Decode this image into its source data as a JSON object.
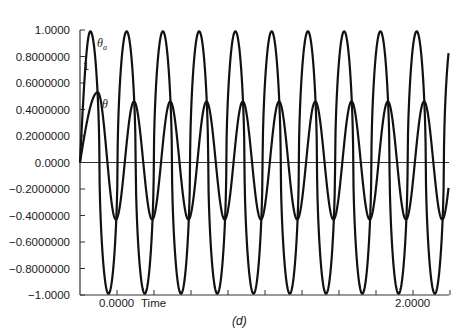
{
  "chart_data": {
    "type": "line",
    "title": "",
    "caption": "(d)",
    "xlabel": "Time",
    "ylabel": "",
    "xlim": [
      -0.25,
      2.25
    ],
    "ylim": [
      -1.0,
      1.0
    ],
    "grid": false,
    "legend_position": "inline labels near left of plot",
    "y_tick_labels": [
      "1.0000",
      "0.8000000",
      "0.6000000",
      "0.4000000",
      "0.2000000",
      "0.0000",
      "−0.2000000",
      "−0.4000000",
      "−0.6000000",
      "−0.8000000",
      "−1.0000"
    ],
    "y_tick_values": [
      1.0,
      0.8,
      0.6,
      0.4,
      0.2,
      0.0,
      -0.2,
      -0.4,
      -0.6,
      -0.8,
      -1.0
    ],
    "x_tick_values": [
      0.0,
      0.25,
      0.5,
      0.75,
      1.0,
      1.25,
      1.5,
      1.75,
      2.0,
      2.25
    ],
    "x_tick_labels_shown": [
      {
        "value": 0.0,
        "label": "0.0000"
      },
      {
        "value": 2.0,
        "label": "2.0000"
      }
    ],
    "annotations": [
      {
        "text": "1",
        "x": -0.22,
        "y": 0.72
      }
    ],
    "series": [
      {
        "name": "θa",
        "label_main": "θ",
        "label_sub": "a",
        "description": "square-ish oscillation between about -1 and +1",
        "amplitude": 0.99,
        "period": 0.245,
        "first_peak_time": -0.18,
        "offset": 0.0,
        "start": [
          -0.25,
          0.0
        ],
        "end": [
          2.24,
          0.8
        ]
      },
      {
        "name": "θ",
        "label_main": "θ",
        "label_sub": "",
        "description": "oscillation with first peak about 0.53 then steady between about -0.43 and 0.46",
        "first_peak": 0.53,
        "steady_max": 0.46,
        "steady_min": -0.43,
        "period": 0.245,
        "first_peak_time": -0.13,
        "start": [
          -0.25,
          0.0
        ],
        "end": [
          2.24,
          -0.07
        ]
      }
    ]
  }
}
